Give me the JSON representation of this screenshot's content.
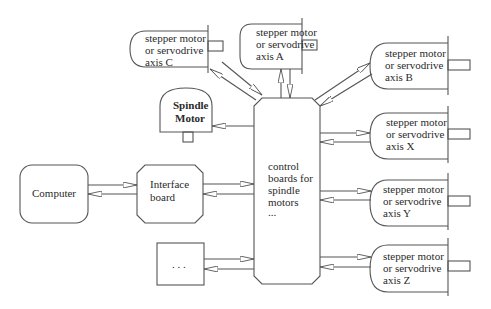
{
  "diagram": {
    "nodes": {
      "computer": {
        "label": "Computer"
      },
      "interface_board": {
        "line1": "Interface",
        "line2": "board"
      },
      "control_boards": {
        "line1": "control",
        "line2": "boards for",
        "line3": "spindle",
        "line4": "motors",
        "line5": "..."
      },
      "spindle_motor": {
        "line1": "Spindle",
        "line2": "Motor"
      },
      "axis_c": {
        "line1": "stepper motor",
        "line2": "or servodrive",
        "line3": "axis C"
      },
      "axis_a": {
        "line1": "stepper motor",
        "line2": "or servodrive",
        "line3": "axis A"
      },
      "axis_b": {
        "line1": "stepper motor",
        "line2": "or servodrive",
        "line3": "axis B"
      },
      "axis_x": {
        "line1": "stepper motor",
        "line2": "or servodrive",
        "line3": "axis X"
      },
      "axis_y": {
        "line1": "stepper motor",
        "line2": "or servodrive",
        "line3": "axis Y"
      },
      "axis_z": {
        "line1": "stepper motor",
        "line2": "or servodrive",
        "line3": "axis Z"
      },
      "other": {
        "label": ". . ."
      }
    },
    "edges": [
      {
        "from": "computer",
        "to": "interface_board",
        "bidirectional": true
      },
      {
        "from": "interface_board",
        "to": "control_boards",
        "bidirectional": true
      },
      {
        "from": "control_boards",
        "to": "spindle_motor",
        "bidirectional": false
      },
      {
        "from": "control_boards",
        "to": "axis_c",
        "bidirectional": true
      },
      {
        "from": "control_boards",
        "to": "axis_a",
        "bidirectional": true
      },
      {
        "from": "control_boards",
        "to": "axis_b",
        "bidirectional": true
      },
      {
        "from": "control_boards",
        "to": "axis_x",
        "bidirectional": true
      },
      {
        "from": "control_boards",
        "to": "axis_y",
        "bidirectional": true
      },
      {
        "from": "control_boards",
        "to": "axis_z",
        "bidirectional": true
      },
      {
        "from": "control_boards",
        "to": "other",
        "bidirectional": true
      }
    ],
    "colors": {
      "stroke": "#555555",
      "background": "#ffffff",
      "text": "#2a2a2a"
    }
  }
}
